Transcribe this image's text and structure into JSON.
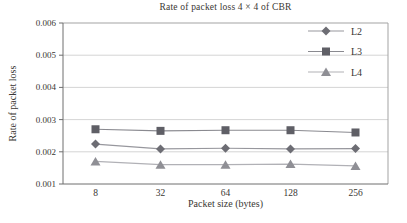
{
  "figure": {
    "background": "#ffffff",
    "text_color": "#3a3733",
    "grid_color": "#c9c9c9",
    "border_color": "#a3a3a3",
    "axis_color": "#6f6f6f"
  },
  "chart_data": {
    "type": "line",
    "title": "Rate of packet loss 4 × 4 of CBR",
    "xlabel": "Packet size (bytes)",
    "ylabel": "Rate of packet loss",
    "categories": [
      "8",
      "32",
      "64",
      "128",
      "256"
    ],
    "series": [
      {
        "name": "L2",
        "marker": "diamond",
        "marker_color": "#6d6d74",
        "line_color": "#97979d",
        "values": [
          0.00224,
          0.00209,
          0.00211,
          0.00209,
          0.0021
        ]
      },
      {
        "name": "L3",
        "marker": "square",
        "marker_color": "#5f5f66",
        "line_color": "#8a8a90",
        "values": [
          0.0027,
          0.00265,
          0.00267,
          0.00267,
          0.0026
        ]
      },
      {
        "name": "L4",
        "marker": "triangle",
        "marker_color": "#8f8f95",
        "line_color": "#b1b1b6",
        "values": [
          0.0017,
          0.0016,
          0.0016,
          0.00162,
          0.00156
        ]
      }
    ],
    "ylim": [
      0.001,
      0.006
    ],
    "ytick_step": 0.001,
    "ytick_labels": [
      "0.001",
      "0.002",
      "0.003",
      "0.004",
      "0.005",
      "0.006"
    ],
    "grid": true,
    "legend_position": "top-right",
    "legend_entries": [
      "L2",
      "L3",
      "L4"
    ]
  }
}
